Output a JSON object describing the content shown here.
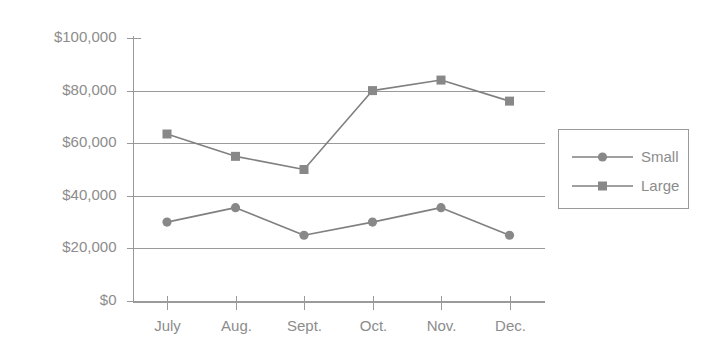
{
  "chart_data": {
    "type": "line",
    "title": "",
    "xlabel": "",
    "ylabel": "",
    "categories": [
      "July",
      "Aug.",
      "Sept.",
      "Oct.",
      "Nov.",
      "Dec."
    ],
    "series": [
      {
        "name": "Small",
        "marker": "circle",
        "color": "#888888",
        "values": [
          30000,
          35500,
          25000,
          30000,
          35500,
          25000
        ]
      },
      {
        "name": "Large",
        "marker": "square",
        "color": "#888888",
        "values": [
          63500,
          55000,
          50000,
          80000,
          84000,
          76000
        ]
      }
    ],
    "ylim": [
      0,
      100000
    ],
    "ytick_values": [
      0,
      20000,
      40000,
      60000,
      80000,
      100000
    ],
    "ytick_labels": [
      "$0",
      "$20,000",
      "$40,000",
      "$60,000",
      "$80,000",
      "$100,000"
    ],
    "gridline_values": [
      0,
      20000,
      40000,
      60000,
      80000
    ],
    "grid": true,
    "legend_position": "right",
    "legend_entries": [
      "Small",
      "Large"
    ]
  },
  "axes": {
    "y_axis_name": "value-axis",
    "x_axis_name": "month-axis"
  },
  "colors": {
    "line": "#808080",
    "marker": "#888888",
    "grid": "#9a9a9a",
    "text": "#8c8c8c",
    "background": "#ffffff"
  }
}
